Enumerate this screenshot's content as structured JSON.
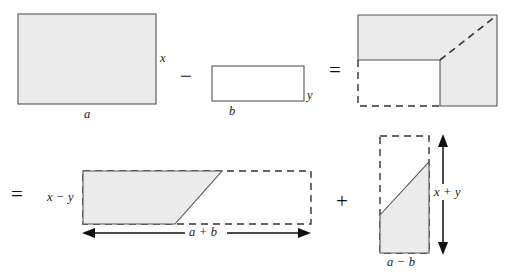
{
  "figure": {
    "background_color": "#fefefe",
    "shape_fill_color": "#ebebeb",
    "shape_stroke_color": "#555555",
    "dashed_stroke_color": "#333333",
    "text_color": "#1b1b1b"
  },
  "operators": {
    "minus_top": "−",
    "equals_top": "=",
    "equals_bottom": "=",
    "plus_bottom": "+"
  },
  "top_row": {
    "rect_a": {
      "name": "shaded rectangle a by x",
      "width_label": "a",
      "height_label": "x",
      "filled": true
    },
    "rect_b": {
      "name": "unshaded rectangle b by y",
      "width_label": "b",
      "height_label": "y",
      "filled": false
    },
    "gnomon": {
      "name": "L-shaped gnomon with dashed cut and dashed diagonal",
      "labels": []
    }
  },
  "bottom_row": {
    "trapezoid": {
      "name": "shaded trapezoid with dashed completion rectangle",
      "height_label": "x − y",
      "width_label": "a + b"
    },
    "right_trapezoid": {
      "name": "shaded right trapezoid with dashed completion rectangle",
      "height_label": "x + y",
      "width_label": "a − b"
    }
  },
  "labels": {
    "a": "a",
    "b": "b",
    "x": "x",
    "y": "y",
    "x_minus_y": "x − y",
    "a_plus_b": "a + b",
    "x_plus_y": "x + y",
    "a_minus_b": "a − b"
  }
}
